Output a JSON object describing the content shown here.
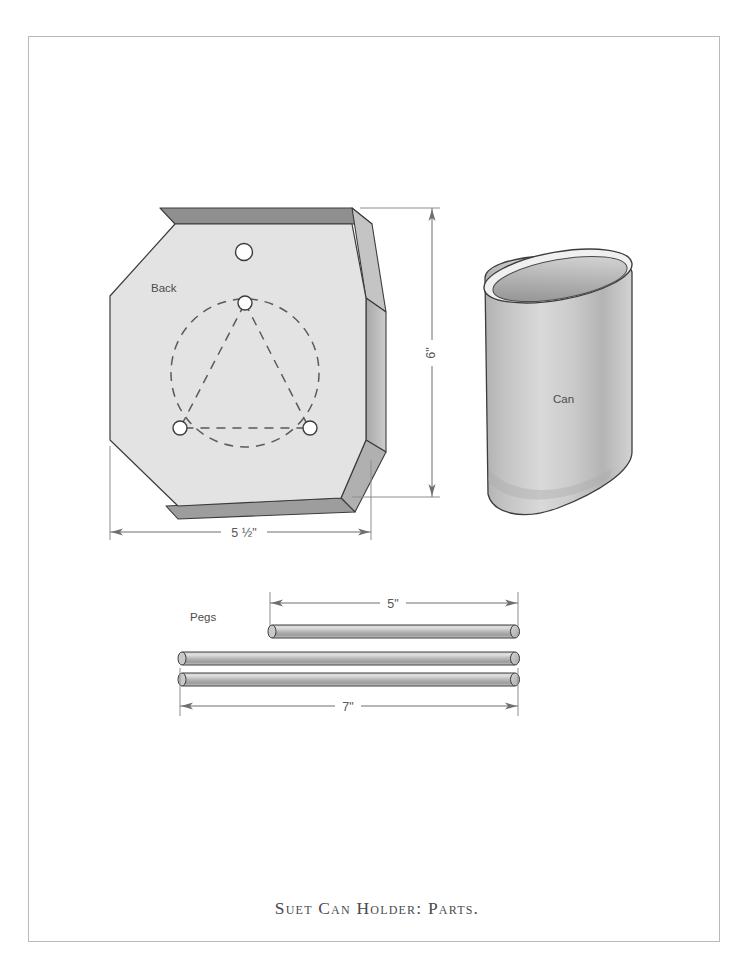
{
  "document": {
    "caption": "Suet Can Holder: Parts.",
    "border_color": "#b9b9b9",
    "background": "#ffffff"
  },
  "parts": [
    {
      "id": "back",
      "label": "Back",
      "shape": "octagon",
      "material_fill": "#e3e3e3",
      "edge_fill": "#bcbcbc",
      "dimensions": [
        {
          "name": "width",
          "value": "5 ½\"",
          "orientation": "horizontal"
        },
        {
          "name": "height",
          "value": "6\"",
          "orientation": "vertical"
        }
      ],
      "holes": {
        "hanging_hole_count": 1,
        "peg_hole_count": 3,
        "layout": "equilateral-triangle-in-dashed-circle"
      }
    },
    {
      "id": "can",
      "label": "Can",
      "shape": "tilted-open-cylinder",
      "body_fill": "#c6c6c6",
      "interior_fill": "#9d9d9d"
    },
    {
      "id": "pegs",
      "label": "Pegs",
      "shape": "dowel-rods",
      "count": 3,
      "body_fill": "#b5b5b5",
      "dimensions": [
        {
          "name": "short-peg",
          "value": "5\"",
          "orientation": "horizontal"
        },
        {
          "name": "long-pegs",
          "value": "7\"",
          "orientation": "horizontal"
        }
      ]
    }
  ],
  "labels": {
    "back": "Back",
    "can": "Can",
    "pegs": "Pegs",
    "dim_width": "5 ½\"",
    "dim_height": "6\"",
    "dim_peg_short": "5\"",
    "dim_peg_long": "7\""
  },
  "colors": {
    "line": "#3c3c3c",
    "dimension_line": "#6f6f6f",
    "panel_face": "#e3e3e3",
    "panel_edge_top": "#9a9a9a",
    "panel_edge_side": "#c2c2c2",
    "hole_fill": "#ffffff",
    "caption_text": "#4a4a52"
  }
}
